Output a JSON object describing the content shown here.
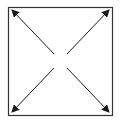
{
  "diagram": {
    "type": "four-way-outward-arrows-in-square",
    "stroke_color": "#1a1a1a",
    "border_color": "#333333",
    "background": "#ffffff",
    "arrows": [
      {
        "name": "up-left",
        "from": [
          54,
          54
        ],
        "to": [
          12,
          10
        ]
      },
      {
        "name": "up-right",
        "from": [
          67,
          54
        ],
        "to": [
          109,
          10
        ]
      },
      {
        "name": "down-left",
        "from": [
          54,
          68
        ],
        "to": [
          12,
          112
        ]
      },
      {
        "name": "down-right",
        "from": [
          67,
          68
        ],
        "to": [
          109,
          112
        ]
      }
    ]
  }
}
